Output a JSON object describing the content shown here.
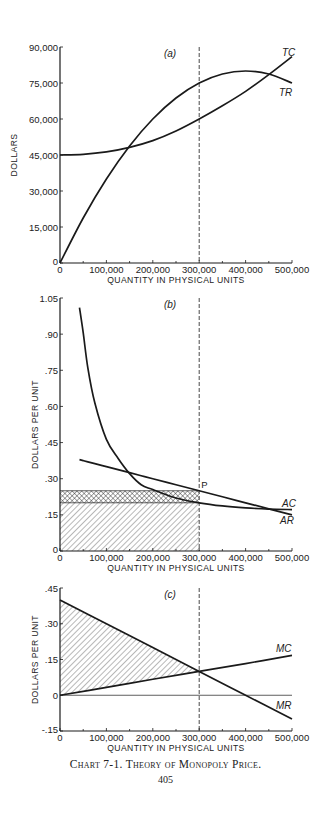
{
  "chart_data": [
    {
      "panel": "(a)",
      "type": "line",
      "title": "",
      "xlabel": "QUANTITY IN PHYSICAL UNITS",
      "ylabel": "DOLLARS",
      "xlim": [
        0,
        500000
      ],
      "ylim": [
        0,
        90000
      ],
      "x_ticks": [
        "0",
        "100,000",
        "200,000",
        "300,000",
        "400,000",
        "500,000"
      ],
      "y_ticks": [
        "0",
        "15,000",
        "30,000",
        "45,000",
        "60,000",
        "75,000",
        "90,000"
      ],
      "x": [
        0,
        50000,
        100000,
        150000,
        200000,
        250000,
        300000,
        350000,
        400000,
        450000,
        500000
      ],
      "series": [
        {
          "name": "TR",
          "values": [
            0,
            18750,
            35000,
            48750,
            60000,
            68750,
            75000,
            78750,
            80000,
            78750,
            75000
          ]
        },
        {
          "name": "TC",
          "values": [
            45000,
            45300,
            46300,
            48200,
            51000,
            55000,
            60000,
            65500,
            71500,
            78500,
            86000
          ]
        }
      ],
      "annotations": [
        {
          "type": "vline",
          "x": 300000,
          "style": "dashed"
        }
      ],
      "grid": false
    },
    {
      "panel": "(b)",
      "type": "line",
      "title": "",
      "xlabel": "QUANTITY IN PHYSICAL UNITS",
      "ylabel": "DOLLARS PER UNIT",
      "xlim": [
        0,
        500000
      ],
      "ylim": [
        0,
        1.05
      ],
      "x_ticks": [
        "0",
        "100,000",
        "200,000",
        "300,000",
        "400,000",
        "500,000"
      ],
      "y_ticks": [
        "0",
        ".15",
        ".30",
        ".45",
        ".60",
        ".75",
        ".90",
        "1.05"
      ],
      "x": [
        42000,
        50000,
        60000,
        75000,
        100000,
        125000,
        150000,
        175000,
        200000,
        250000,
        300000,
        350000,
        400000,
        450000,
        500000
      ],
      "series": [
        {
          "name": "AC",
          "values": [
            1.01,
            0.906,
            0.76,
            0.615,
            0.463,
            0.385,
            0.321,
            0.275,
            0.255,
            0.22,
            0.2,
            0.187,
            0.179,
            0.174,
            0.172
          ]
        },
        {
          "name": "AR",
          "values": [
            0.379,
            0.375,
            0.37,
            0.3625,
            0.35,
            0.3375,
            0.325,
            0.3125,
            0.3,
            0.275,
            0.25,
            0.225,
            0.2,
            0.175,
            0.15
          ]
        }
      ],
      "regions": [
        {
          "name": "profit-area",
          "pattern": "crosshatch",
          "x": [
            0,
            300000
          ],
          "y": [
            0.2,
            0.25
          ]
        },
        {
          "name": "cost-area",
          "pattern": "diagonal-hatch",
          "x": [
            0,
            300000
          ],
          "y": [
            0,
            0.2
          ]
        }
      ],
      "point_labels": [
        {
          "label": "P",
          "x": 300000,
          "y": 0.25
        }
      ],
      "annotations": [
        {
          "type": "vline",
          "x": 300000,
          "style": "dashed"
        }
      ],
      "grid": false
    },
    {
      "panel": "(c)",
      "type": "line",
      "title": "",
      "xlabel": "QUANTITY IN PHYSICAL UNITS",
      "ylabel": "DOLLARS PER UNIT",
      "xlim": [
        0,
        500000
      ],
      "ylim": [
        -0.15,
        0.45
      ],
      "x_ticks": [
        "0",
        "100,000",
        "200,000",
        "300,000",
        "400,000",
        "500,000"
      ],
      "y_ticks": [
        "-.15",
        "0",
        ".15",
        ".30",
        ".45"
      ],
      "x": [
        0,
        100000,
        200000,
        300000,
        400000,
        500000
      ],
      "series": [
        {
          "name": "MR",
          "values": [
            0.4,
            0.3,
            0.2,
            0.1,
            0.0,
            -0.1
          ]
        },
        {
          "name": "MC",
          "values": [
            0.0,
            0.033,
            0.067,
            0.1,
            0.133,
            0.167
          ]
        }
      ],
      "regions": [
        {
          "name": "surplus-area",
          "pattern": "diagonal-hatch",
          "between": [
            "MR",
            "MC"
          ],
          "x": [
            0,
            300000
          ]
        }
      ],
      "annotations": [
        {
          "type": "vline",
          "x": 300000,
          "style": "dashed"
        },
        {
          "type": "hline",
          "y": 0
        }
      ],
      "grid": false
    }
  ],
  "caption": {
    "title": "Chart 7-1.   Theory of Monopoly Price.",
    "page_number": "405"
  },
  "layout": {
    "x0": 60,
    "x1": 292,
    "panels": [
      {
        "y_at_min": 263,
        "y_at_max": 47
      },
      {
        "y_at_min": 551,
        "y_at_max": 298
      },
      {
        "y_at_min": 731,
        "y_at_max": 588
      }
    ],
    "ink": "#1a1a1a"
  }
}
